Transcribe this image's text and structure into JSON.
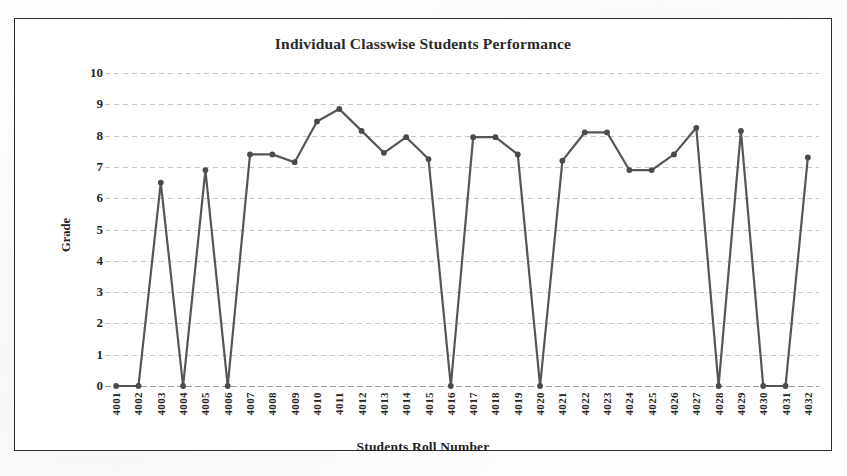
{
  "figure": {
    "border_color": "#2c2c2c",
    "background": "#ffffff"
  },
  "chart_data": {
    "type": "line",
    "title": "Individual  Classwise Students Performance",
    "xlabel": "Students Roll Number",
    "ylabel": "Grade",
    "ylim": [
      0,
      10
    ],
    "ytick_step": 1,
    "grid": true,
    "legend": "none",
    "line_color": "#555555",
    "marker": "circle",
    "marker_color": "#4a4a4a",
    "categories": [
      "4001",
      "4002",
      "4003",
      "4004",
      "4005",
      "4006",
      "4007",
      "4008",
      "4009",
      "4010",
      "4011",
      "4012",
      "4013",
      "4014",
      "4015",
      "4016",
      "4017",
      "4018",
      "4019",
      "4020",
      "4021",
      "4022",
      "4023",
      "4024",
      "4025",
      "4026",
      "4027",
      "4028",
      "4029",
      "4030",
      "4031",
      "4032"
    ],
    "yticks": [
      "0",
      "1",
      "2",
      "3",
      "4",
      "5",
      "6",
      "7",
      "8",
      "9",
      "10"
    ],
    "values": [
      0,
      0,
      6.5,
      0,
      6.9,
      0,
      7.4,
      7.4,
      7.15,
      8.45,
      8.85,
      8.15,
      7.45,
      7.95,
      7.25,
      0,
      7.95,
      7.95,
      7.4,
      0,
      7.2,
      8.1,
      8.1,
      6.9,
      6.9,
      7.4,
      8.25,
      0,
      8.15,
      0,
      0,
      7.3
    ]
  }
}
